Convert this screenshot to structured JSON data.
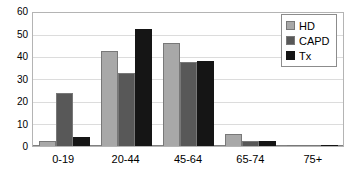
{
  "chart_data": {
    "type": "bar",
    "title": "",
    "subtitle": "",
    "xlabel": "",
    "ylabel": "",
    "categories": [
      "0-19",
      "20-44",
      "45-64",
      "65-74",
      "75+"
    ],
    "series": [
      {
        "name": "HD",
        "color": "#a8a8a8",
        "values": [
          2.2,
          42.8,
          46.3,
          5.2,
          0.4
        ]
      },
      {
        "name": "CAPD",
        "color": "#585858",
        "values": [
          24.0,
          33.0,
          38.0,
          2.3,
          0.4
        ]
      },
      {
        "name": "Tx",
        "color": "#151515",
        "values": [
          4.2,
          53.0,
          38.5,
          2.2,
          0.3
        ]
      }
    ],
    "ylim": [
      0,
      60
    ],
    "yticks": [
      0,
      10,
      20,
      30,
      40,
      50,
      60
    ],
    "ytick_labels": [
      "0",
      "10",
      "20",
      "30",
      "40",
      "50",
      "60"
    ],
    "grid": true,
    "grid_axis": "y",
    "legend": {
      "position": "top-right",
      "entries": [
        "HD",
        "CAPD",
        "Tx"
      ]
    },
    "annotations": []
  }
}
